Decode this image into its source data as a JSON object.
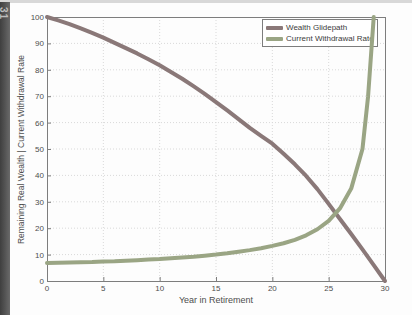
{
  "page": {
    "page_number": "31"
  },
  "colors": {
    "frame": "#7d7d7d",
    "grid": "#d9d9d9",
    "tick_text": "#4d4d4d",
    "gutter": "#515151",
    "top_band": "#d8d8d8",
    "legend_border": "#7d7d7d"
  },
  "chart_data": {
    "type": "line",
    "title": "",
    "xlabel": "Year in Retirement",
    "ylabel": "Remaining Real Wealth | Current Withdrawal Rate",
    "xlim": [
      0,
      30
    ],
    "ylim": [
      0,
      100
    ],
    "x_ticks": [
      0,
      5,
      10,
      15,
      20,
      25,
      30
    ],
    "y_ticks": [
      0,
      10,
      20,
      30,
      40,
      50,
      60,
      70,
      80,
      90,
      100
    ],
    "grid": true,
    "legend_position": "top-right",
    "series": [
      {
        "name": "Wealth Glidepath",
        "color": "#8a7878",
        "x": [
          0,
          1,
          2,
          3,
          4,
          5,
          6,
          7,
          8,
          9,
          10,
          11,
          12,
          13,
          14,
          15,
          16,
          17,
          18,
          19,
          20,
          21,
          22,
          23,
          24,
          25,
          26,
          27,
          28,
          29,
          30
        ],
        "values": [
          100,
          98.7,
          97.3,
          95.7,
          94,
          92.2,
          90.2,
          88.2,
          86.2,
          84,
          81.7,
          79.2,
          76.6,
          73.8,
          70.9,
          67.8,
          64.6,
          61.3,
          58,
          55,
          52,
          48.2,
          44.2,
          39.8,
          34.8,
          29.2,
          23.5,
          17.8,
          12,
          6,
          0
        ]
      },
      {
        "name": "Current Withdrawal Rate",
        "color": "#9aa584",
        "x": [
          0,
          1,
          2,
          3,
          4,
          5,
          6,
          7,
          8,
          9,
          10,
          11,
          12,
          13,
          14,
          15,
          16,
          17,
          18,
          19,
          20,
          21,
          22,
          23,
          24,
          25,
          26,
          27,
          28,
          28.5,
          29
        ],
        "values": [
          6.8,
          6.9,
          7,
          7.1,
          7.2,
          7.4,
          7.5,
          7.7,
          7.9,
          8.1,
          8.3,
          8.6,
          8.9,
          9.2,
          9.6,
          10,
          10.5,
          11.1,
          11.7,
          12.4,
          13.3,
          14.3,
          15.6,
          17.3,
          19.6,
          22.8,
          27.5,
          35,
          50,
          70,
          100
        ]
      }
    ]
  }
}
